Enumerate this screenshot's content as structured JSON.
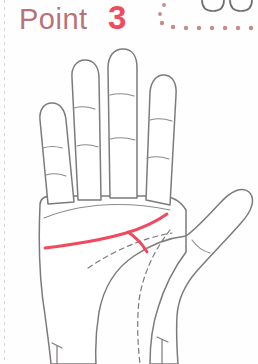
{
  "page": {
    "background_color": "#fefefe",
    "width": 258,
    "height": 364,
    "perforation": {
      "name": "page-perforation-line",
      "color": "#cfc9c9"
    }
  },
  "header": {
    "label": "Point",
    "number": "3",
    "label_color": "#b5747a",
    "number_color": "#ef4a60",
    "decoration": {
      "name": "dotted-arc-decoration",
      "dot_color": "#c98a8a",
      "dots": [
        {
          "cx": 16,
          "cy": 5,
          "r": 1.9
        },
        {
          "cx": 12,
          "cy": 14,
          "r": 1.9
        },
        {
          "cx": 14,
          "cy": 23,
          "r": 2.2
        },
        {
          "cx": 25,
          "cy": 27,
          "r": 2.2
        },
        {
          "cx": 38,
          "cy": 28,
          "r": 2.2
        },
        {
          "cx": 51,
          "cy": 28,
          "r": 2.2
        },
        {
          "cx": 64,
          "cy": 28,
          "r": 2.2
        },
        {
          "cx": 77,
          "cy": 28,
          "r": 2.2
        },
        {
          "cx": 90,
          "cy": 28,
          "r": 2.2
        },
        {
          "cx": 103,
          "cy": 28,
          "r": 2.2
        }
      ]
    },
    "cut_off_shape": {
      "name": "cut-off-fingertips-shape",
      "color": "#6e6e6e",
      "description": "two rounded outlines cropped by the top edge"
    }
  },
  "illustration": {
    "name": "palm-reading-diagram",
    "type": "palmistry-hand",
    "outline_color": "#7d7a7b",
    "crease_color": "#8d8a8b",
    "dashed_line_color": "#7d7a7b",
    "highlight_color": "#ef4a60",
    "fill_color": "#ffffff",
    "parts": {
      "palm_outline": "left palm facing viewer with four fingers and thumb at right",
      "fingers": [
        {
          "name": "pinky-finger",
          "creases": 2
        },
        {
          "name": "ring-finger",
          "creases": 2
        },
        {
          "name": "middle-finger",
          "creases": 2
        },
        {
          "name": "index-finger",
          "creases": 2
        }
      ],
      "thumb": {
        "name": "thumb",
        "creases": 1
      },
      "highlighted_line": {
        "name": "heart-line-highlight",
        "color": "#ef4a60",
        "has_fork": true,
        "description": "bold red heart line rising left-to-right with a downward fork branch"
      },
      "dashed_lines": [
        {
          "name": "head-line-dashed"
        },
        {
          "name": "life-line-dashed"
        }
      ],
      "wrist_creases": 2
    }
  }
}
